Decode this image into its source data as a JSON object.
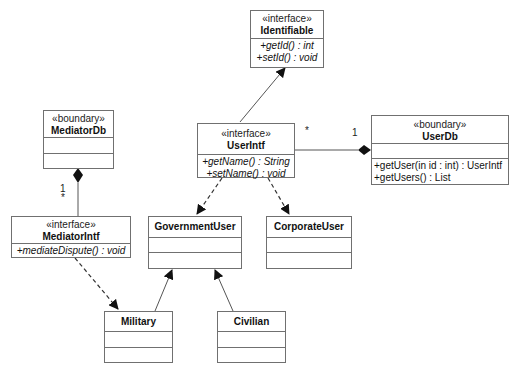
{
  "diagram": {
    "type": "UML class diagram",
    "classes": {
      "identifiable": {
        "stereotype": "«interface»",
        "name": "Identifiable",
        "operations": [
          "+getId() : int",
          "+setId() : void"
        ]
      },
      "mediator_db": {
        "stereotype": "«boundary»",
        "name": "MediatorDb",
        "operations": []
      },
      "user_intf": {
        "stereotype": "«interface»",
        "name": "UserIntf",
        "operations": [
          "+getName() : String",
          "+setName() : void"
        ]
      },
      "user_db": {
        "stereotype": "«boundary»",
        "name": "UserDb",
        "operations": [
          "+getUser(in id : int) : UserIntf",
          "+getUsers() : List"
        ]
      },
      "mediator_intf": {
        "stereotype": "«interface»",
        "name": "MediatorIntf",
        "operations": [
          "+mediateDispute() : void"
        ]
      },
      "government_user": {
        "name": "GovernmentUser"
      },
      "corporate_user": {
        "name": "CorporateUser"
      },
      "military": {
        "name": "Military"
      },
      "civilian": {
        "name": "Civilian"
      }
    },
    "multiplicities": {
      "userintf_end": "*",
      "userdb_end": "1",
      "mediatordb_end": "1",
      "mediatorintf_end": "*"
    },
    "relationships": [
      {
        "from": "UserIntf",
        "to": "Identifiable",
        "kind": "generalization"
      },
      {
        "from": "UserDb",
        "to": "UserIntf",
        "kind": "composition"
      },
      {
        "from": "MediatorDb",
        "to": "MediatorIntf",
        "kind": "composition"
      },
      {
        "from": "UserIntf",
        "to": "GovernmentUser",
        "kind": "dependency"
      },
      {
        "from": "UserIntf",
        "to": "CorporateUser",
        "kind": "dependency"
      },
      {
        "from": "MediatorIntf",
        "to": "Military",
        "kind": "dependency"
      },
      {
        "from": "Military",
        "to": "GovernmentUser",
        "kind": "generalization"
      },
      {
        "from": "Civilian",
        "to": "GovernmentUser",
        "kind": "generalization"
      }
    ],
    "colors": {
      "line": "#555555",
      "border": "#707070",
      "fill": "#ffffff"
    }
  }
}
